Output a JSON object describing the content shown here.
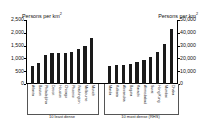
{
  "chart_data": {
    "type": "bar",
    "title": "",
    "ylabel": "Persons per km2",
    "ylabel_right": "Persons per km2",
    "xlabel": "",
    "ylim": [
      0,
      2500
    ],
    "ylim_right": [
      0,
      50000
    ],
    "grid": false,
    "legend": "none",
    "yticks": [
      "0",
      "500",
      "1,000",
      "1,500",
      "2,000",
      "2,500"
    ],
    "ytick_values": [
      0,
      500,
      1000,
      1500,
      2000,
      2500
    ],
    "yticks_right": [
      "0",
      "10,000",
      "20,000",
      "30,000",
      "40,000",
      "50,000"
    ],
    "ytick_values_right": [
      0,
      10000,
      20000,
      30000,
      40000,
      50000
    ],
    "groups": [
      {
        "name": "10 least dense",
        "axis": "left",
        "caption": "10 least dense",
        "categories": [
          "Atlanta",
          "Boston",
          "Philadelphia",
          "Detroit",
          "Houston",
          "Chicago",
          "Phoenix",
          "Washington",
          "Melbourne",
          "Munich"
        ],
        "values": [
          700,
          840,
          1140,
          1200,
          1230,
          1230,
          1250,
          1380,
          1480,
          1790
        ]
      },
      {
        "name": "10 most dense (RHS)",
        "axis": "right",
        "caption": "10 most dense (RHS)",
        "categories": [
          "Manila",
          "Kolkata",
          "Alexandria",
          "Bogota",
          "Karachi",
          "Ahmedabad",
          "Surat",
          "Hong Kong",
          "Mumbai",
          "Dhaka"
        ],
        "values": [
          14000,
          15000,
          15000,
          16000,
          17000,
          19000,
          21000,
          25000,
          31000,
          43000
        ]
      }
    ]
  },
  "axes": {
    "left_title_main": "Persons per km",
    "left_title_sup": "2",
    "right_title_main": "Persons per km",
    "right_title_sup": "2"
  }
}
